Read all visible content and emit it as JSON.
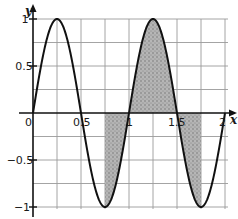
{
  "chart_data": {
    "type": "line",
    "title": "",
    "function": "y = sin(2*pi*x)",
    "xlabel": "x",
    "ylabel": "y",
    "xlim": [
      0,
      2
    ],
    "ylim": [
      -1,
      1
    ],
    "grid": true,
    "grid_step_x": 0.25,
    "grid_step_y": 0.25,
    "x_ticks": [
      0,
      0.5,
      1,
      1.5,
      2
    ],
    "x_tick_labels": [
      "0",
      "0.5",
      "1",
      "1.5",
      "2"
    ],
    "y_ticks": [
      -1,
      -0.5,
      0.5,
      1
    ],
    "y_tick_labels": [
      "−1",
      "−0.5",
      "0.5",
      "1"
    ],
    "series": [
      {
        "name": "sin(2πx)",
        "x": [
          0,
          0.25,
          0.5,
          0.75,
          1,
          1.25,
          1.5,
          1.75,
          2
        ],
        "y": [
          0,
          1,
          0,
          -1,
          0,
          1,
          0,
          -1,
          0
        ]
      }
    ],
    "shaded_region": {
      "description": "Area between the curve and the x-axis",
      "x_start": 0.75,
      "x_end": 1.75,
      "bounded_by": [
        "curve",
        "y = 0"
      ]
    },
    "legend": null
  },
  "labels": {
    "x_axis": "x",
    "y_axis": "y",
    "origin": "0",
    "x_05": "0.5",
    "x_1": "1",
    "x_15": "1.5",
    "x_2": "2",
    "y_1": "1",
    "y_05": "0.5",
    "y_m05": "−0.5",
    "y_m1": "−1"
  },
  "colors": {
    "curve": "#111111",
    "grid": "#9a9a9a",
    "axis": "#111111",
    "shade": "#a9a9a9"
  }
}
